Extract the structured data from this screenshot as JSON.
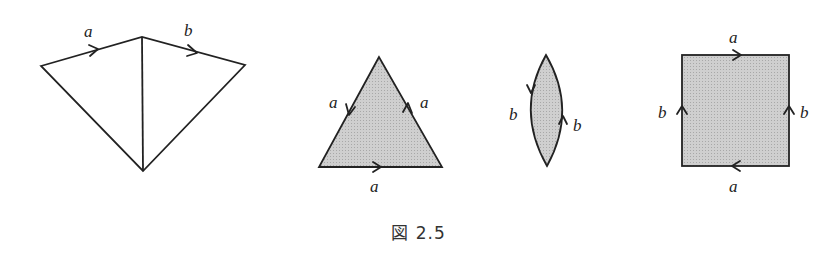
{
  "caption": "図 2.5",
  "figures": {
    "kite": {
      "edge_labels": {
        "top_left": "a",
        "top_right": "b"
      }
    },
    "triangle": {
      "edge_labels": {
        "left": "a",
        "right": "a",
        "bottom": "a"
      }
    },
    "lens": {
      "edge_labels": {
        "left": "b",
        "right": "b"
      }
    },
    "square": {
      "edge_labels": {
        "top": "a",
        "bottom": "a",
        "left": "b",
        "right": "b"
      }
    }
  },
  "colors": {
    "fill": "#c9c9c9",
    "stroke": "#222222"
  }
}
